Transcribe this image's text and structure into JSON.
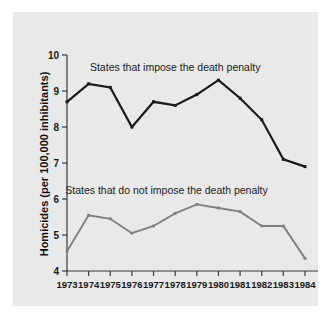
{
  "chart_data": {
    "type": "line",
    "title": "",
    "xlabel": "",
    "ylabel": "Homicides (per 100,000 inhibitants)",
    "x": [
      1973,
      1974,
      1975,
      1976,
      1977,
      1978,
      1979,
      1980,
      1981,
      1982,
      1983,
      1984
    ],
    "xtick_labels": [
      "1973",
      "1974",
      "1975",
      "1976",
      "1977",
      "1978",
      "1979",
      "1980",
      "1981",
      "1982",
      "1983",
      "1984"
    ],
    "ytick_labels": [
      "10",
      "9",
      "8",
      "7",
      "6",
      "5",
      "4"
    ],
    "ytick_values": [
      10,
      9,
      8,
      7,
      6,
      5,
      4
    ],
    "ylim": [
      4,
      10
    ],
    "xlim": [
      1973,
      1984
    ],
    "grid": false,
    "legend_position": "inline-annotation",
    "series": [
      {
        "name": "States that impose the death penalty",
        "color": "#1a1a1a",
        "marker": "square",
        "values": [
          8.7,
          9.2,
          9.1,
          8.0,
          8.7,
          8.6,
          8.9,
          9.3,
          8.8,
          8.2,
          7.1,
          6.9
        ]
      },
      {
        "name": "States that do not impose the death penalty",
        "color": "#808080",
        "marker": "square",
        "values": [
          4.55,
          5.55,
          5.45,
          5.05,
          5.25,
          5.6,
          5.85,
          5.75,
          5.65,
          5.25,
          5.25,
          4.35
        ]
      }
    ],
    "annotations": [
      {
        "text": "States that impose the death penalty",
        "x_value": 1978.0,
        "y_value": 9.55
      },
      {
        "text": "States that do not impose the death penalty",
        "x_value": 1977.6,
        "y_value": 6.15
      }
    ]
  }
}
